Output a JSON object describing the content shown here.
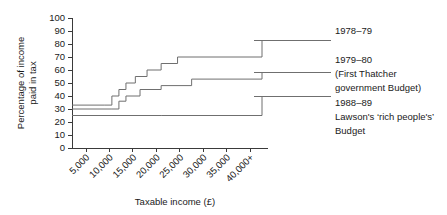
{
  "chart_data": {
    "type": "line",
    "title": "",
    "xlabel": "Taxable income (£)",
    "ylabel": "Percentage of income paid in tax",
    "xtick_labels": [
      "5,000",
      "10,000",
      "15,000",
      "20,000",
      "25,000",
      "30,000",
      "35,000",
      "40,000+"
    ],
    "xtick_values": [
      5000,
      10000,
      15000,
      20000,
      25000,
      30000,
      35000,
      40000
    ],
    "ytick_labels": [
      "0",
      "10",
      "20",
      "30",
      "40",
      "50",
      "60",
      "70",
      "80",
      "90",
      "100"
    ],
    "ytick_values": [
      0,
      10,
      20,
      30,
      40,
      50,
      60,
      70,
      80,
      90,
      100
    ],
    "xlim": [
      2000,
      42500
    ],
    "ylim": [
      0,
      100
    ],
    "grid": false,
    "legend_position": "right",
    "step_type": "post",
    "series": [
      {
        "name": "1978–79",
        "label_lines": [
          "1978–79"
        ],
        "color": "#6f6f6f",
        "x": [
          2000,
          9000,
          10500,
          12000,
          13500,
          15500,
          18000,
          21000,
          24500,
          42500
        ],
        "y": [
          33,
          33,
          40,
          45,
          50,
          55,
          60,
          65,
          70,
          83
        ]
      },
      {
        "name": "1979–80 (First Thatcher government Budget)",
        "label_lines": [
          "1979–80",
          "(First Thatcher",
          "government Budget)"
        ],
        "color": "#6f6f6f",
        "x": [
          2000,
          10500,
          12000,
          13500,
          16500,
          21000,
          27500,
          42500
        ],
        "y": [
          30,
          30,
          36,
          40,
          45,
          48,
          53,
          58
        ]
      },
      {
        "name": "1988–89 Lawson's ‘rich people's’ Budget",
        "label_lines": [
          "1988–89",
          "Lawson's ‘rich people's’",
          "Budget"
        ],
        "color": "#6f6f6f",
        "x": [
          2000,
          21000,
          42500
        ],
        "y": [
          25,
          25,
          40
        ]
      }
    ],
    "legend_entries": [
      {
        "lines": [
          "1978–79"
        ],
        "leader_y_value": 83
      },
      {
        "lines": [
          "1979–80",
          "(First Thatcher",
          "government Budget)"
        ],
        "leader_y_value": 58
      },
      {
        "lines": [
          "1988–89",
          "Lawson's ‘rich people's’",
          "Budget"
        ],
        "leader_y_value": 40
      }
    ]
  }
}
